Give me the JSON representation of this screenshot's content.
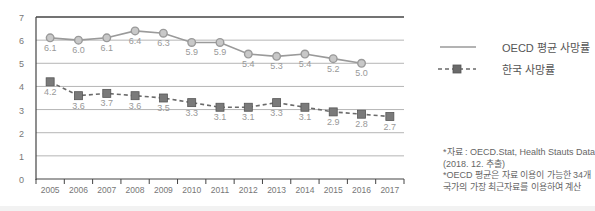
{
  "chart_data": {
    "type": "line",
    "title": "",
    "xlabel": "",
    "ylabel": "",
    "ylim": [
      0,
      7
    ],
    "yticks": [
      0,
      1,
      2,
      3,
      4,
      5,
      6,
      7
    ],
    "grid": true,
    "legend_position": "right",
    "categories": [
      "2005",
      "2006",
      "2007",
      "2008",
      "2009",
      "2010",
      "2011",
      "2012",
      "2013",
      "2014",
      "2015",
      "2016",
      "2017"
    ],
    "series": [
      {
        "name": "OECD 평균 사망률",
        "style": "solid",
        "marker": "circle",
        "color": "#9a9a9a",
        "values": [
          6.1,
          6.0,
          6.1,
          6.4,
          6.3,
          5.9,
          5.9,
          5.4,
          5.3,
          5.4,
          5.2,
          5.0,
          null
        ]
      },
      {
        "name": "한국 사망률",
        "style": "dashed",
        "marker": "square",
        "color": "#6a6a6a",
        "values": [
          4.2,
          3.6,
          3.7,
          3.6,
          3.5,
          3.3,
          3.1,
          3.1,
          3.3,
          3.1,
          2.9,
          2.8,
          2.7
        ]
      }
    ]
  },
  "legend": {
    "items": [
      {
        "label": "OECD 평균 사망률"
      },
      {
        "label": "한국 사망률"
      }
    ]
  },
  "notes": {
    "line1": "*자료 : OECD.Stat, Health Stauts Data",
    "line2": "(2018. 12. 추출)",
    "line3": "*OECD 평균은 자료 이용이 가능한 34개",
    "line4": "국가의 가장 최근자료를 이용하여 계산"
  }
}
